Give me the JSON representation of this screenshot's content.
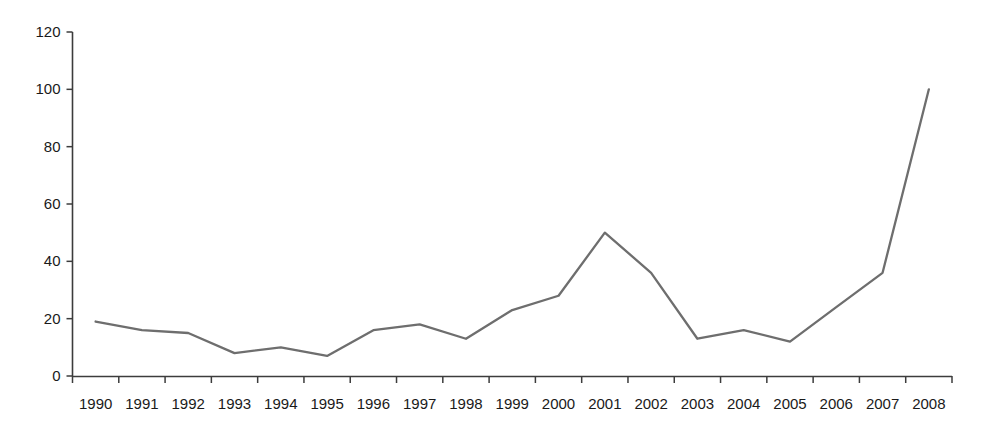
{
  "chart_data": {
    "type": "line",
    "title": "",
    "subtitle": "",
    "xlabel": "",
    "ylabel": "",
    "categories": [
      "1990",
      "1991",
      "1992",
      "1993",
      "1994",
      "1995",
      "1996",
      "1997",
      "1998",
      "1999",
      "2000",
      "2001",
      "2002",
      "2003",
      "2004",
      "2005",
      "2006",
      "2007",
      "2008"
    ],
    "values": [
      19,
      16,
      15,
      8,
      10,
      7,
      16,
      18,
      13,
      23,
      28,
      50,
      36,
      13,
      16,
      12,
      24,
      36,
      100
    ],
    "series": [
      {
        "name": "",
        "values": [
          19,
          16,
          15,
          8,
          10,
          7,
          16,
          18,
          13,
          23,
          28,
          50,
          36,
          13,
          16,
          12,
          24,
          36,
          100
        ]
      }
    ],
    "ylim": [
      0,
      120
    ],
    "yticks": [
      0,
      20,
      40,
      60,
      80,
      100,
      120
    ],
    "ytick_labels": [
      "0",
      "20",
      "40",
      "60",
      "80",
      "100",
      "120"
    ],
    "xtick_labels": [
      "1990",
      "1991",
      "1992",
      "1993",
      "1994",
      "1995",
      "1996",
      "1997",
      "1998",
      "1999",
      "2000",
      "2001",
      "2002",
      "2003",
      "2004",
      "2005",
      "2006",
      "2007",
      "2008"
    ],
    "grid": false,
    "legend": null,
    "legend_position": "none",
    "line_color": "#6e6e6e",
    "axis_color": "#3c3c3c",
    "text_color": "#1a1a1a",
    "background_color": "#ffffff",
    "annotations": []
  }
}
